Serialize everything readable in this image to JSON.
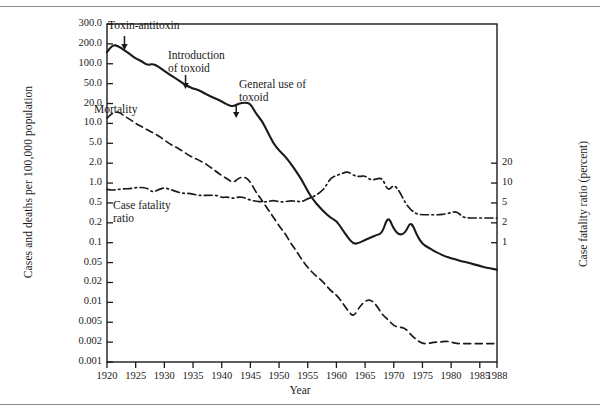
{
  "figure": {
    "background": "#ffffff",
    "ink": "#1a1a1a",
    "rule_color": "#8c8c8c"
  },
  "chart_data": {
    "type": "line",
    "title": "",
    "xlabel": "Year",
    "ylabel": "Cases and deaths per 100,000 population",
    "ylabel_right": "Case fatality ratio (percent)",
    "xlim": [
      1920,
      1988
    ],
    "ylim": [
      0.001,
      300
    ],
    "yscale": "log",
    "ylim_right": [
      0.5,
      30
    ],
    "yscale_right": "log",
    "grid": false,
    "legend": "inline-annotations",
    "xticks": [
      1920,
      1925,
      1930,
      1935,
      1940,
      1945,
      1950,
      1955,
      1960,
      1965,
      1970,
      1975,
      1980,
      1985,
      1988
    ],
    "xticklabels": [
      "1920",
      "1925",
      "1930",
      "1935",
      "1940",
      "1945",
      "1950",
      "1955",
      "1960",
      "1965",
      "1970",
      "1975",
      "1980",
      "1985",
      "1988"
    ],
    "yticks": [
      300,
      200,
      100,
      50,
      20,
      10,
      5,
      2,
      1,
      0.5,
      0.2,
      0.1,
      0.05,
      0.02,
      0.01,
      0.005,
      0.002,
      0.001
    ],
    "yticklabels": [
      "300.0",
      "200.0",
      "100.0",
      "50.0",
      "20.0",
      "10.0",
      "5.0",
      "2.0",
      "1.0",
      "0.5",
      "0.2",
      "0.1",
      "0.05",
      "0.02",
      "0.01",
      "0.005",
      "0.002",
      "0.001"
    ],
    "yticks_right": [
      20,
      10,
      5,
      2,
      1
    ],
    "yticklabels_right": [
      "20",
      "10",
      "5",
      "2",
      "1"
    ],
    "series": [
      {
        "name": "Cases",
        "label": "Cases",
        "style": "solid",
        "axis": "left",
        "x": [
          1920,
          1921,
          1922,
          1923,
          1924,
          1925,
          1926,
          1927,
          1928,
          1929,
          1930,
          1931,
          1932,
          1933,
          1934,
          1935,
          1936,
          1937,
          1938,
          1939,
          1940,
          1941,
          1942,
          1943,
          1944,
          1945,
          1946,
          1947,
          1948,
          1949,
          1950,
          1951,
          1952,
          1953,
          1954,
          1955,
          1956,
          1957,
          1958,
          1959,
          1960,
          1961,
          1962,
          1963,
          1964,
          1965,
          1966,
          1967,
          1968,
          1969,
          1970,
          1971,
          1972,
          1973,
          1974,
          1975,
          1976,
          1977,
          1978,
          1979,
          1980,
          1981,
          1982,
          1983,
          1984,
          1985,
          1986,
          1987,
          1988
        ],
        "y": [
          150,
          195,
          185,
          160,
          140,
          120,
          110,
          95,
          100,
          90,
          78,
          68,
          60,
          52,
          45,
          40,
          37,
          32,
          28,
          25,
          22,
          19,
          18,
          20,
          21,
          20,
          14,
          11,
          7.5,
          5.0,
          3.6,
          2.8,
          2.0,
          1.5,
          1.1,
          0.75,
          0.55,
          0.42,
          0.32,
          0.25,
          0.22,
          0.16,
          0.12,
          0.095,
          0.1,
          0.11,
          0.12,
          0.13,
          0.14,
          0.28,
          0.16,
          0.13,
          0.14,
          0.22,
          0.13,
          0.095,
          0.085,
          0.075,
          0.068,
          0.062,
          0.058,
          0.055,
          0.052,
          0.05,
          0.046,
          0.043,
          0.04,
          0.038,
          0.036
        ]
      },
      {
        "name": "Mortality",
        "label": "Mortality",
        "style": "dashed",
        "axis": "left",
        "x": [
          1920,
          1921,
          1922,
          1923,
          1924,
          1925,
          1926,
          1927,
          1928,
          1929,
          1930,
          1931,
          1932,
          1933,
          1934,
          1935,
          1936,
          1937,
          1938,
          1939,
          1940,
          1941,
          1942,
          1943,
          1944,
          1945,
          1946,
          1947,
          1948,
          1949,
          1950,
          1951,
          1952,
          1953,
          1954,
          1955,
          1956,
          1957,
          1958,
          1959,
          1960,
          1961,
          1962,
          1963,
          1964,
          1965,
          1966,
          1967,
          1968,
          1969,
          1970,
          1971,
          1972,
          1973,
          1974,
          1975,
          1976,
          1977,
          1978,
          1979,
          1980,
          1981,
          1982,
          1983,
          1984,
          1985,
          1986,
          1987,
          1988
        ],
        "y": [
          12,
          14.5,
          15,
          13,
          11.5,
          10,
          9.0,
          8.0,
          7.2,
          6.5,
          5.6,
          4.8,
          4.2,
          3.6,
          3.0,
          2.6,
          2.3,
          2.0,
          1.75,
          1.5,
          1.3,
          1.15,
          1.0,
          1.2,
          1.25,
          1.05,
          0.72,
          0.55,
          0.38,
          0.26,
          0.18,
          0.14,
          0.1,
          0.075,
          0.055,
          0.04,
          0.03,
          0.024,
          0.019,
          0.015,
          0.013,
          0.01,
          0.0075,
          0.006,
          0.0085,
          0.0105,
          0.011,
          0.009,
          0.0065,
          0.0055,
          0.0042,
          0.004,
          0.0038,
          0.0028,
          0.0022,
          0.0019,
          0.0019,
          0.002,
          0.002,
          0.0021,
          0.002,
          0.0019,
          0.0019,
          0.0019,
          0.0019,
          0.0019,
          0.0019,
          0.0019,
          0.0019
        ]
      },
      {
        "name": "Case fatality ratio",
        "label": "Case fatality ratio",
        "style": "dash-dot",
        "axis": "right",
        "x": [
          1920,
          1921,
          1922,
          1923,
          1924,
          1925,
          1926,
          1927,
          1928,
          1929,
          1930,
          1931,
          1932,
          1933,
          1934,
          1935,
          1936,
          1937,
          1938,
          1939,
          1940,
          1941,
          1942,
          1943,
          1944,
          1945,
          1946,
          1947,
          1948,
          1949,
          1950,
          1951,
          1952,
          1953,
          1954,
          1955,
          1956,
          1957,
          1958,
          1959,
          1960,
          1961,
          1962,
          1963,
          1964,
          1965,
          1966,
          1967,
          1968,
          1969,
          1970,
          1971,
          1972,
          1973,
          1974,
          1975,
          1976,
          1977,
          1978,
          1979,
          1980,
          1981,
          1982,
          1983,
          1984,
          1985,
          1986,
          1987,
          1988
        ],
        "y": [
          8.0,
          7.8,
          8.0,
          8.2,
          8.2,
          8.5,
          8.6,
          8.4,
          7.2,
          8.0,
          8.5,
          8.0,
          7.5,
          7.0,
          7.0,
          6.8,
          6.5,
          6.5,
          6.5,
          6.6,
          6.0,
          6.2,
          5.8,
          6.2,
          6.0,
          5.5,
          5.3,
          5.2,
          5.2,
          5.5,
          5.2,
          5.2,
          5.4,
          5.3,
          5.2,
          5.8,
          6.2,
          7.0,
          8.5,
          12.0,
          13.0,
          14.0,
          15.0,
          13.0,
          12.5,
          13.0,
          11.0,
          11.5,
          12.0,
          7.5,
          9.5,
          7.5,
          5.0,
          3.6,
          3.0,
          2.9,
          2.9,
          2.9,
          2.9,
          3.0,
          3.2,
          3.4,
          2.6,
          2.5,
          2.5,
          2.5,
          2.5,
          2.5,
          2.5
        ]
      }
    ],
    "annotations": [
      {
        "name": "toxin-antitoxin",
        "text": "Toxin-antitoxin",
        "year": 1922,
        "arrow": true
      },
      {
        "name": "introduction-of-toxoid",
        "text_line1": "Introduction",
        "text_line2": "of toxoid",
        "year": 1933,
        "arrow": true
      },
      {
        "name": "general-use-of-toxoid",
        "text_line1": "General use of",
        "text_line2": "toxoid",
        "year": 1942,
        "arrow": true
      },
      {
        "name": "mortality-label",
        "text": "Mortality",
        "year": 1923,
        "arrow": false
      },
      {
        "name": "case-fatality-ratio-label",
        "text_line1": "Case fatality",
        "text_line2": "ratio",
        "year": 1923,
        "arrow": false
      }
    ]
  }
}
